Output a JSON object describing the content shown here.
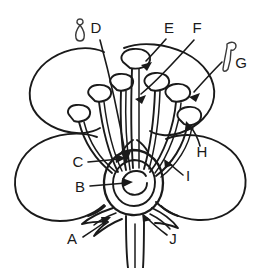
{
  "figure": {
    "background_color": "#ffffff",
    "ink_color": "#1a1a1a",
    "width": 262,
    "height": 268
  },
  "labels": [
    {
      "id": "A",
      "text": "A",
      "x": 72,
      "y": 240
    },
    {
      "id": "B",
      "text": "B",
      "x": 80,
      "y": 188
    },
    {
      "id": "C",
      "text": "C",
      "x": 78,
      "y": 163
    },
    {
      "id": "D",
      "text": "D",
      "x": 96,
      "y": 29
    },
    {
      "id": "E",
      "text": "E",
      "x": 169,
      "y": 29
    },
    {
      "id": "F",
      "text": "F",
      "x": 197,
      "y": 29
    },
    {
      "id": "G",
      "text": "G",
      "x": 241,
      "y": 64
    },
    {
      "id": "H",
      "text": "H",
      "x": 202,
      "y": 153
    },
    {
      "id": "I",
      "text": "I",
      "x": 188,
      "y": 177
    },
    {
      "id": "J",
      "text": "J",
      "x": 173,
      "y": 240
    }
  ],
  "icons": [
    {
      "id": "d-icon",
      "name": "stamen-pin-icon",
      "near_label": "D"
    },
    {
      "id": "g-icon",
      "name": "stamen-hook-icon",
      "near_label": "G"
    }
  ],
  "parts": [
    {
      "name": "petal-left-upper"
    },
    {
      "name": "petal-right-upper"
    },
    {
      "name": "petal-left-lower"
    },
    {
      "name": "petal-right-lower"
    },
    {
      "name": "stamen-cluster"
    },
    {
      "name": "ovary"
    },
    {
      "name": "sepals"
    },
    {
      "name": "pedicel"
    }
  ]
}
